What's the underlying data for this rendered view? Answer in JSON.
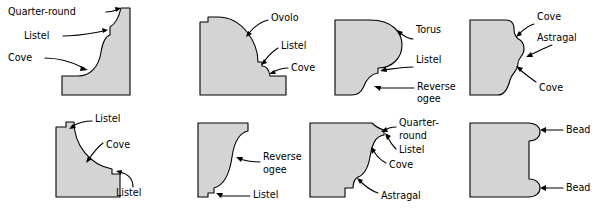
{
  "figure": {
    "colors": {
      "shape_fill": "#d4d4d4",
      "outline": "#000000",
      "background": "#ffffff",
      "label_text": "#000000"
    },
    "layout": {
      "columns": 4,
      "rows": 2,
      "total_profiles": 8
    }
  },
  "profiles": [
    {
      "id": "profile-1",
      "position": "top-left",
      "labels": [
        {
          "text": "Quarter-round",
          "line2": ""
        },
        {
          "text": "Listel",
          "line2": ""
        },
        {
          "text": "Cove",
          "line2": ""
        }
      ]
    },
    {
      "id": "profile-2",
      "position": "top-second",
      "labels": [
        {
          "text": "Ovolo",
          "line2": ""
        },
        {
          "text": "Listel",
          "line2": ""
        },
        {
          "text": "Cove",
          "line2": ""
        }
      ]
    },
    {
      "id": "profile-3",
      "position": "top-third",
      "labels": [
        {
          "text": "Torus",
          "line2": ""
        },
        {
          "text": "Listel",
          "line2": ""
        },
        {
          "text": "Reverse",
          "line2": "ogee"
        }
      ]
    },
    {
      "id": "profile-4",
      "position": "top-right",
      "labels": [
        {
          "text": "Cove",
          "line2": ""
        },
        {
          "text": "Astragal",
          "line2": ""
        },
        {
          "text": "Cove",
          "line2": ""
        }
      ]
    },
    {
      "id": "profile-5",
      "position": "bottom-left",
      "labels": [
        {
          "text": "Listel",
          "line2": ""
        },
        {
          "text": "Cove",
          "line2": ""
        },
        {
          "text": "Listel",
          "line2": ""
        }
      ]
    },
    {
      "id": "profile-6",
      "position": "bottom-second",
      "labels": [
        {
          "text": "Reverse",
          "line2": "ogee"
        },
        {
          "text": "Listel",
          "line2": ""
        }
      ]
    },
    {
      "id": "profile-7",
      "position": "bottom-third",
      "labels": [
        {
          "text": "Quarter-",
          "line2": "round"
        },
        {
          "text": "Listel",
          "line2": ""
        },
        {
          "text": "Cove",
          "line2": ""
        },
        {
          "text": "Astragal",
          "line2": ""
        }
      ]
    },
    {
      "id": "profile-8",
      "position": "bottom-right",
      "labels": [
        {
          "text": "Bead",
          "line2": ""
        },
        {
          "text": "Bead",
          "line2": ""
        }
      ]
    }
  ]
}
